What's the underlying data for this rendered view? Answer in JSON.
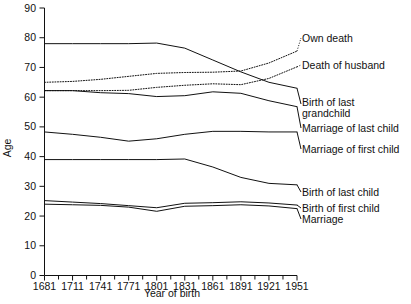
{
  "chart_data": {
    "type": "line",
    "title": "",
    "xlabel": "Year of birth",
    "ylabel": "Age",
    "xlim": [
      1681,
      1951
    ],
    "ylim": [
      0,
      90
    ],
    "xticks": [
      1681,
      1711,
      1741,
      1771,
      1801,
      1831,
      1861,
      1891,
      1921,
      1951
    ],
    "yticks": [
      0,
      10,
      20,
      30,
      40,
      50,
      60,
      70,
      80,
      90
    ],
    "minor_xticks": true,
    "grid": false,
    "legend_position": "right-inline-labels",
    "x": [
      1681,
      1711,
      1741,
      1771,
      1801,
      1831,
      1861,
      1891,
      1921,
      1951
    ],
    "series": [
      {
        "name": "Own death",
        "style": "dotted",
        "label_lines": [
          "Own death"
        ],
        "values": [
          65.0,
          65.3,
          66.0,
          67.0,
          68.0,
          68.3,
          68.4,
          68.8,
          71.5,
          75.5
        ]
      },
      {
        "name": "Death of husband",
        "style": "dotted",
        "label_lines": [
          "Death of husband"
        ],
        "values": [
          62.2,
          62.2,
          62.2,
          62.3,
          63.3,
          64.0,
          64.5,
          64.2,
          66.3,
          70.2
        ]
      },
      {
        "name": "Birth of last grandchild",
        "style": "solid",
        "label_lines": [
          "Birth of last",
          "grandchild"
        ],
        "values": [
          78.0,
          78.0,
          78.0,
          78.0,
          78.2,
          76.5,
          72.5,
          68.5,
          65.0,
          63.0
        ]
      },
      {
        "name": "Marriage of last child",
        "style": "solid",
        "label_lines": [
          "Marriage of last child"
        ],
        "values": [
          62.2,
          62.2,
          61.5,
          61.2,
          60.2,
          60.5,
          61.8,
          61.3,
          58.8,
          56.8
        ]
      },
      {
        "name": "Marriage of first child",
        "style": "solid",
        "label_lines": [
          "Marriage of first child"
        ],
        "values": [
          48.3,
          47.5,
          46.5,
          45.2,
          46.0,
          47.5,
          48.5,
          48.5,
          48.3,
          48.3
        ]
      },
      {
        "name": "Birth of last child",
        "style": "solid",
        "label_lines": [
          "Birth of last child"
        ],
        "values": [
          39.0,
          39.0,
          39.0,
          39.0,
          39.0,
          39.2,
          36.5,
          33.0,
          31.0,
          30.5
        ]
      },
      {
        "name": "Birth of first child",
        "style": "solid",
        "label_lines": [
          "Birth of first child"
        ],
        "values": [
          25.2,
          24.7,
          24.2,
          23.5,
          22.8,
          24.3,
          24.5,
          24.8,
          24.4,
          23.7
        ]
      },
      {
        "name": "Marriage",
        "style": "solid",
        "label_lines": [
          "Marriage"
        ],
        "values": [
          24.0,
          23.8,
          23.6,
          23.0,
          21.6,
          23.3,
          23.5,
          23.8,
          23.4,
          22.5
        ]
      }
    ]
  },
  "axis": {
    "y_title": "Age",
    "x_title": "Year of birth",
    "y_tick_labels": [
      "0",
      "10",
      "20",
      "30",
      "40",
      "50",
      "60",
      "70",
      "80",
      "90"
    ],
    "x_tick_labels": [
      "1681",
      "1711",
      "1741",
      "1771",
      "1801",
      "1831",
      "1861",
      "1891",
      "1921",
      "1951"
    ]
  },
  "labels": {
    "own_death": "Own death",
    "death_of_husband": "Death of husband",
    "birth_of_last_grandchild_1": "Birth of last",
    "birth_of_last_grandchild_2": "grandchild",
    "marriage_of_last_child": "Marriage of last child",
    "marriage_of_first_child": "Marriage of first child",
    "birth_of_last_child": "Birth of last child",
    "birth_of_first_child": "Birth of first child",
    "marriage": "Marriage"
  },
  "colors": {
    "ink": "#111111",
    "background": "#ffffff"
  }
}
